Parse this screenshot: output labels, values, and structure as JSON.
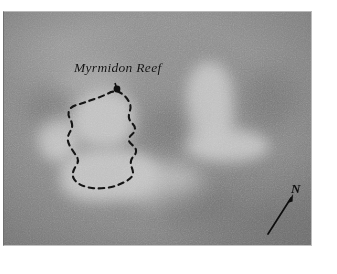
{
  "figure": {
    "type": "greyscale-aerial-photograph",
    "background_color": "#8a8a8a",
    "highlight_color": "#c3c3c3",
    "ink_color": "#111111",
    "plate": {
      "left": 3,
      "top": 11,
      "width": 309,
      "height": 235
    }
  },
  "annotations": {
    "reef_label": "Myrmidon Reef",
    "north_label": "N"
  },
  "reef_outline": {
    "style": "dashed",
    "closed": true,
    "leader_dot": {
      "x": 117,
      "y": 89
    },
    "points": [
      [
        117,
        91
      ],
      [
        126,
        98
      ],
      [
        130,
        104
      ],
      [
        128,
        111
      ],
      [
        131,
        118
      ],
      [
        135,
        125
      ],
      [
        133,
        132
      ],
      [
        129,
        137
      ],
      [
        132,
        143
      ],
      [
        136,
        149
      ],
      [
        133,
        155
      ],
      [
        128,
        161
      ],
      [
        131,
        167
      ],
      [
        133,
        173
      ],
      [
        128,
        179
      ],
      [
        118,
        185
      ],
      [
        106,
        188
      ],
      [
        94,
        188
      ],
      [
        84,
        186
      ],
      [
        76,
        181
      ],
      [
        73,
        174
      ],
      [
        75,
        167
      ],
      [
        79,
        161
      ],
      [
        76,
        155
      ],
      [
        71,
        150
      ],
      [
        68,
        143
      ],
      [
        69,
        136
      ],
      [
        73,
        130
      ],
      [
        71,
        123
      ],
      [
        68,
        116
      ],
      [
        70,
        110
      ],
      [
        76,
        106
      ],
      [
        85,
        102
      ],
      [
        95,
        98
      ],
      [
        104,
        95
      ],
      [
        111,
        92
      ]
    ]
  },
  "north_arrow": {
    "tail": {
      "x": 268,
      "y": 234
    },
    "head": {
      "x": 293,
      "y": 195
    },
    "label_position": {
      "x": 291,
      "y": 181
    }
  },
  "reef_features": [
    {
      "name": "west-shoal",
      "x": 44,
      "y": 120,
      "w": 36,
      "h": 42,
      "tone": "bright"
    },
    {
      "name": "central-shoal",
      "x": 74,
      "y": 96,
      "w": 62,
      "h": 56,
      "tone": "bright"
    },
    {
      "name": "south-bank",
      "x": 62,
      "y": 150,
      "w": 95,
      "h": 52,
      "tone": "bright"
    },
    {
      "name": "southeast-apron",
      "x": 128,
      "y": 160,
      "w": 70,
      "h": 40,
      "tone": "soft"
    },
    {
      "name": "east-reef-stem",
      "x": 188,
      "y": 64,
      "w": 46,
      "h": 82,
      "tone": "bright"
    },
    {
      "name": "east-reef-foot",
      "x": 186,
      "y": 130,
      "w": 82,
      "h": 32,
      "tone": "bright"
    },
    {
      "name": "north-haze",
      "x": 56,
      "y": 70,
      "w": 70,
      "h": 30,
      "tone": "dim"
    }
  ]
}
